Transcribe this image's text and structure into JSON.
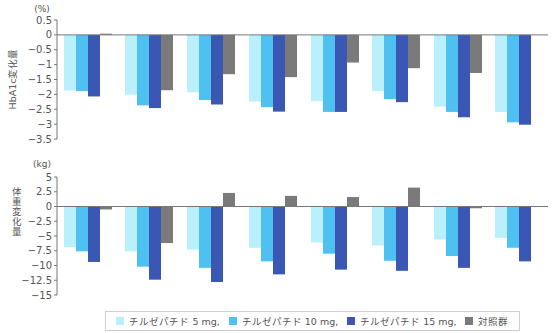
{
  "chart_data": [
    {
      "type": "bar",
      "title": "",
      "unit_label": "(%)",
      "ylabel": "HbA1c変化量",
      "xlabel": "",
      "ylim": [
        -3.5,
        0.5
      ],
      "yticks": [
        "0.5",
        "0",
        "-0.5",
        "-1",
        "-1.5",
        "-2",
        "-2.5",
        "-3",
        "-3.5"
      ],
      "categories": [
        "1",
        "2",
        "3",
        "4",
        "5",
        "6",
        "7",
        "8"
      ],
      "series": [
        {
          "name": "チルゼパチド 5 mg",
          "color": "#b9f0fb",
          "values": [
            -1.87,
            -2.01,
            -1.93,
            -2.24,
            -2.23,
            -1.89,
            -2.41,
            -2.59
          ]
        },
        {
          "name": "チルゼパチド 10 mg",
          "color": "#4fc1f0",
          "values": [
            -1.89,
            -2.37,
            -2.19,
            -2.43,
            -2.59,
            -2.16,
            -2.59,
            -2.94
          ]
        },
        {
          "name": "チルゼパチド 15 mg",
          "color": "#3b57b4",
          "values": [
            -2.07,
            -2.46,
            -2.34,
            -2.58,
            -2.59,
            -2.26,
            -2.77,
            -3.02
          ]
        },
        {
          "name": "対照群",
          "color": "#7a7a7a",
          "values": [
            0.04,
            -1.86,
            -1.32,
            -1.42,
            -0.93,
            -1.12,
            -1.28,
            null
          ]
        }
      ],
      "grid": false
    },
    {
      "type": "bar",
      "title": "",
      "unit_label": "(kg)",
      "ylabel": "体重変化量",
      "xlabel": "",
      "ylim": [
        -15,
        5
      ],
      "yticks": [
        "5",
        "2.5",
        "0",
        "-2.5",
        "-5",
        "-7.5",
        "-10",
        "-12.5",
        "-15"
      ],
      "categories": [
        "1",
        "2",
        "3",
        "4",
        "5",
        "6",
        "7",
        "8"
      ],
      "series": [
        {
          "name": "チルゼパチド 5 mg",
          "color": "#b9f0fb",
          "values": [
            -6.9,
            -7.6,
            -7.3,
            -7.0,
            -6.1,
            -6.6,
            -5.6,
            -5.3
          ]
        },
        {
          "name": "チルゼパチド 10 mg",
          "color": "#4fc1f0",
          "values": [
            -7.6,
            -10.2,
            -10.4,
            -9.3,
            -8.0,
            -9.2,
            -8.4,
            -7.0
          ]
        },
        {
          "name": "チルゼパチド 15 mg",
          "color": "#3b57b4",
          "values": [
            -9.4,
            -12.4,
            -12.8,
            -11.5,
            -10.7,
            -10.9,
            -10.4,
            -9.3
          ]
        },
        {
          "name": "対照群",
          "color": "#7a7a7a",
          "values": [
            -0.5,
            -6.2,
            2.3,
            1.8,
            1.6,
            3.2,
            -0.3,
            null
          ]
        }
      ],
      "grid": false
    }
  ],
  "legend": {
    "items": [
      {
        "label": "チルゼパチド 5 mg,",
        "color": "#b9f0fb"
      },
      {
        "label": "チルゼパチド 10 mg,",
        "color": "#4fc1f0"
      },
      {
        "label": "チルゼパチド 15 mg,",
        "color": "#3b57b4"
      },
      {
        "label": "対照群",
        "color": "#7a7a7a"
      }
    ]
  }
}
